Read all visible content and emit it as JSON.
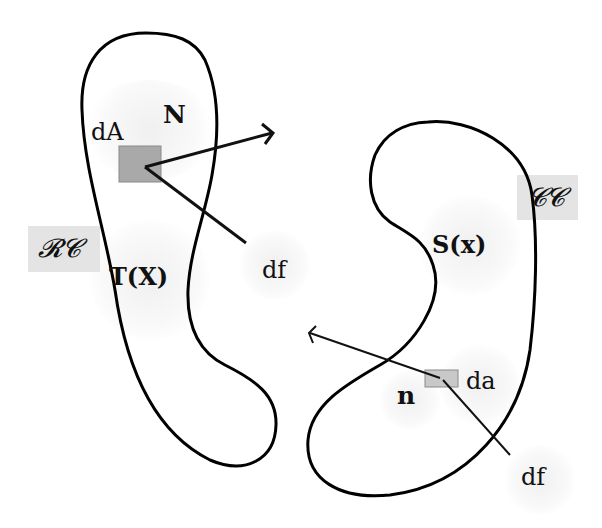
{
  "diagram": {
    "reference_configuration": {
      "tag_label": "𝓡𝓒",
      "area_label": "dA",
      "normal_label": "N",
      "traction_label": "T(X)",
      "force_label": "df",
      "area_patch_color": "#a9a9a9"
    },
    "current_configuration": {
      "tag_label": "𝓒𝓒",
      "area_label": "da",
      "normal_label": "n",
      "traction_label": "S(x)",
      "force_label": "df",
      "area_patch_color": "#c8c8c8"
    },
    "colors": {
      "outline": "#000000",
      "tag_background": "#e4e4e4",
      "background": "#ffffff"
    }
  }
}
